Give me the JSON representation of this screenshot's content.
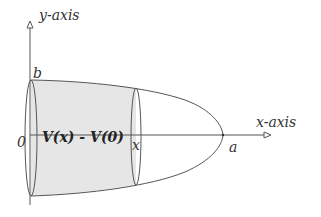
{
  "diagram": {
    "type": "solid-of-revolution",
    "labels": {
      "y_axis": "y-axis",
      "x_axis": "x-axis",
      "b": "b",
      "origin": "0",
      "x": "x",
      "a": "a",
      "volume": "V(x) - V(0)"
    },
    "colors": {
      "line": "#555555",
      "fill": "#e6e6e6",
      "text": "#333333"
    }
  }
}
